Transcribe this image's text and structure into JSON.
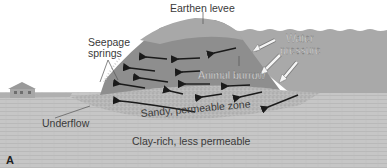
{
  "labels": {
    "levee": "Earthen levee",
    "seepage_line1": "Seepage",
    "seepage_line2": "springs",
    "water_line1": "Water",
    "water_line2": "pressure",
    "burrow": "Animal burrow",
    "sandy": "Sandy, permeable zone",
    "underflow": "Underflow",
    "clay": "Clay-rich, less permeable",
    "panel": "A"
  },
  "colors": {
    "background": "#ffffff",
    "clay": "#c6c6c6",
    "sandy": "#b4b4b4",
    "levee_core": "#8e8e8e",
    "levee_cap": "#a6a6a6",
    "water": "#a9a9a9",
    "arrow_dark": "#1a1a1a",
    "arrow_light": "#f5f5f5",
    "house": "#a0a0a0"
  }
}
